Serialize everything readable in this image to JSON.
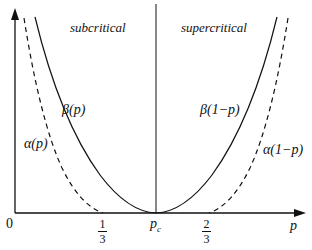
{
  "diagram": {
    "regions": {
      "left": "subcritical",
      "right": "supercritical"
    },
    "curves": [
      {
        "id": "beta_p",
        "label": "β(p)",
        "style": "solid"
      },
      {
        "id": "alpha_p",
        "label": "α(p)",
        "style": "dashed"
      },
      {
        "id": "beta_1mp",
        "label": "β(1−p)",
        "style": "solid"
      },
      {
        "id": "alpha_1mp",
        "label": "α(1−p)",
        "style": "dashed"
      }
    ],
    "axis": {
      "x_label": "p",
      "origin_label": "0",
      "ticks": [
        {
          "num": "1",
          "den": "3"
        },
        {
          "main": "p",
          "sub": "c"
        },
        {
          "num": "2",
          "den": "3"
        }
      ]
    },
    "colors": {
      "line": "#111111",
      "background": "#ffffff"
    }
  }
}
